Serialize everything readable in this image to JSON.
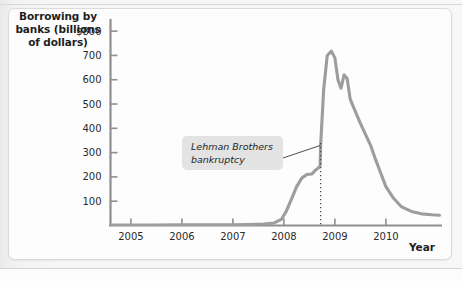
{
  "figure": {
    "y_axis_title_lines": [
      "Borrowing by",
      "banks (billions",
      "of dollars)"
    ],
    "x_axis_title": "Year",
    "annotation_lines": [
      "Lehman Brothers",
      "bankruptcy"
    ]
  },
  "colors": {
    "line": "#9d9d9d",
    "axis": "#8f8f8f",
    "text": "#1d1d1d",
    "annotation_box": "#e2e2e2",
    "panel": "#fdfdfd",
    "page_background": "#f2f2f2"
  },
  "chart_data": {
    "type": "line",
    "title": "",
    "xlabel": "Year",
    "ylabel": "Borrowing by banks (billions of dollars)",
    "xlim": [
      2004.6,
      2011.1
    ],
    "ylim": [
      0,
      850
    ],
    "ytick_labels": [
      "$800",
      "700",
      "600",
      "500",
      "400",
      "300",
      "200",
      "100"
    ],
    "ytick_values": [
      800,
      700,
      600,
      500,
      400,
      300,
      200,
      100
    ],
    "xtick_labels": [
      "2005",
      "2006",
      "2007",
      "2008",
      "2009",
      "2010"
    ],
    "xtick_values": [
      2005,
      2006,
      2007,
      2008,
      2009,
      2010
    ],
    "grid": false,
    "legend": null,
    "series": [
      {
        "name": "Borrowing by banks",
        "x": [
          2004.62,
          2005.0,
          2005.5,
          2006.0,
          2006.5,
          2007.0,
          2007.3,
          2007.6,
          2007.8,
          2007.95,
          2008.05,
          2008.15,
          2008.25,
          2008.35,
          2008.45,
          2008.55,
          2008.62,
          2008.68,
          2008.71,
          2008.72,
          2008.78,
          2008.85,
          2008.93,
          2009.0,
          2009.06,
          2009.12,
          2009.18,
          2009.24,
          2009.3,
          2009.4,
          2009.5,
          2009.6,
          2009.7,
          2009.8,
          2009.9,
          2010.0,
          2010.15,
          2010.3,
          2010.5,
          2010.7,
          2010.9,
          2011.05
        ],
        "y": [
          2,
          2,
          2,
          3,
          3,
          3,
          4,
          6,
          10,
          25,
          60,
          110,
          160,
          195,
          210,
          212,
          228,
          238,
          245,
          330,
          560,
          700,
          718,
          690,
          600,
          565,
          620,
          605,
          520,
          470,
          420,
          375,
          330,
          270,
          215,
          160,
          112,
          78,
          58,
          48,
          44,
          42
        ]
      }
    ],
    "annotations": [
      {
        "text": "Lehman Brothers bankruptcy",
        "points_to_x": 2008.72,
        "marker": "dotted vertical line at September 2008"
      }
    ]
  }
}
